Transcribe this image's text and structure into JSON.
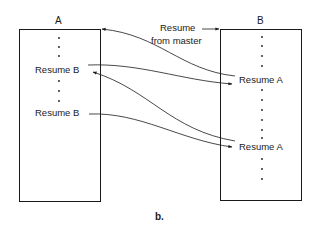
{
  "diagram": {
    "caption": "b.",
    "box_a": {
      "title": "A",
      "labels": [
        "Resume B",
        "Resume B"
      ]
    },
    "box_b": {
      "title": "B",
      "labels": [
        "Resume A",
        "Resume A"
      ]
    },
    "entry_label_line1": "Resume",
    "entry_label_line2": "from master",
    "arrows": [
      {
        "from": "B: Resume A (1)",
        "to": "A: start"
      },
      {
        "from": "A: Resume B (1)",
        "to": "B: Resume A (1)"
      },
      {
        "from": "B: Resume A (2)",
        "to": "A: Resume B (1)"
      },
      {
        "from": "A: Resume B (2)",
        "to": "B: Resume A (2)"
      },
      {
        "from": "master",
        "to": "B: start"
      }
    ]
  }
}
